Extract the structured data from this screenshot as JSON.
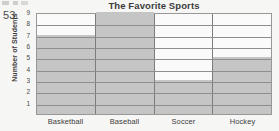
{
  "worksheet": {
    "question_number": "53."
  },
  "chart_data": {
    "type": "bar",
    "title": "The Favorite Sports",
    "xlabel": "",
    "ylabel": "Number of Students",
    "categories": [
      "Basketball",
      "Baseball",
      "Soccer",
      "Hockey"
    ],
    "values": [
      7,
      9,
      3,
      5
    ],
    "ylim": [
      0,
      9
    ],
    "yticks": [
      9,
      8,
      7,
      6,
      5,
      4,
      3,
      2,
      1
    ],
    "grid": true,
    "legend": "none",
    "colors": {
      "bar_fill": "#c9c9c9",
      "bar_border": "#7d7d7d",
      "gridline": "#8f8f8f",
      "frame": "#9a9a9a",
      "text": "#3c3c3c"
    }
  }
}
